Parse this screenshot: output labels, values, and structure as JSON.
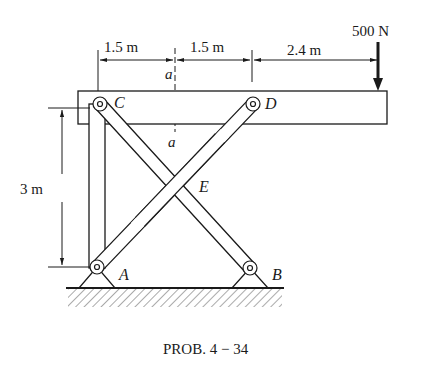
{
  "figure": {
    "caption": "PROB. 4 − 34",
    "load": {
      "label": "500 N",
      "value": 500,
      "unit": "N"
    },
    "dimensions": {
      "horizontal": [
        {
          "label": "1.5 m",
          "value": 1.5
        },
        {
          "label": "1.5 m",
          "value": 1.5
        },
        {
          "label": "2.4 m",
          "value": 2.4
        }
      ],
      "vertical": {
        "label": "3 m",
        "value": 3
      }
    },
    "points": {
      "A": "A",
      "B": "B",
      "C": "C",
      "D": "D",
      "E": "E"
    },
    "section": {
      "top": "a",
      "bottom": "a"
    }
  },
  "colors": {
    "ink": "#1a1a1a",
    "background": "#ffffff",
    "hatch": "#555555"
  }
}
